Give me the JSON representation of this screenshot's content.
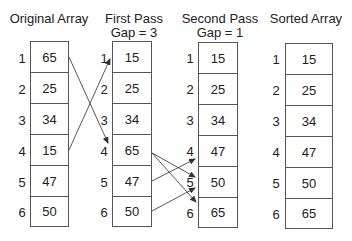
{
  "columns": [
    {
      "title": "Original Array",
      "subtitle": "",
      "values": [
        "65",
        "25",
        "34",
        "15",
        "47",
        "50"
      ]
    },
    {
      "title": "First Pass",
      "subtitle": "Gap = 3",
      "values": [
        "15",
        "25",
        "34",
        "65",
        "47",
        "50"
      ]
    },
    {
      "title": "Second Pass",
      "subtitle": "Gap = 1",
      "values": [
        "15",
        "25",
        "34",
        "47",
        "50",
        "65"
      ]
    },
    {
      "title": "Sorted Array",
      "subtitle": "",
      "values": [
        "15",
        "25",
        "34",
        "47",
        "50",
        "65"
      ]
    }
  ],
  "indices": [
    "1",
    "2",
    "3",
    "4",
    "5",
    "6"
  ],
  "arrows": [
    {
      "from_col": 0,
      "from_row": 1,
      "to_col": 1,
      "to_row": 4
    },
    {
      "from_col": 0,
      "from_row": 4,
      "to_col": 1,
      "to_row": 1
    },
    {
      "from_col": 1,
      "from_row": 4,
      "to_col": 2,
      "to_row": 5
    },
    {
      "from_col": 1,
      "from_row": 4,
      "to_col": 2,
      "to_row": 6
    },
    {
      "from_col": 1,
      "from_row": 5,
      "to_col": 2,
      "to_row": 4
    },
    {
      "from_col": 1,
      "from_row": 6,
      "to_col": 2,
      "to_row": 5
    }
  ]
}
